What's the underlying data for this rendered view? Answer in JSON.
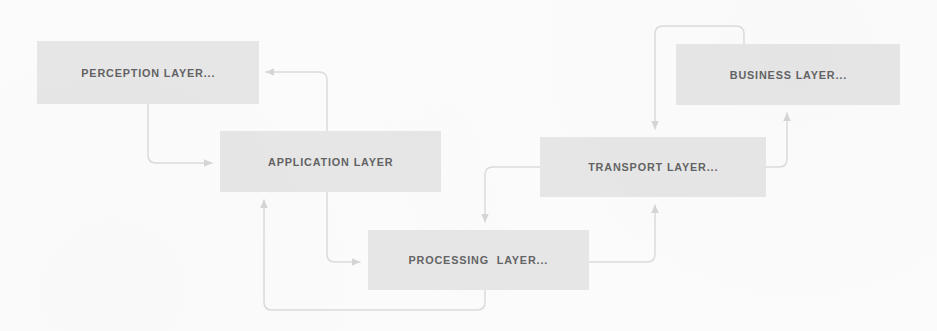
{
  "diagram": {
    "type": "block-flow-diagram",
    "background_color": "#fcfcfc",
    "node_fill_color": "#e7e7e7",
    "edge_color": "#dcdcdc",
    "text_color": "#58585a",
    "nodes": [
      {
        "id": "perception",
        "label": "PERCEPTION LAYER...",
        "x": 37,
        "y": 41,
        "w": 222,
        "h": 63
      },
      {
        "id": "application",
        "label": "APPLICATION LAYER",
        "x": 220,
        "y": 131,
        "w": 221,
        "h": 61
      },
      {
        "id": "processing",
        "label": "PROCESSING  LAYER...",
        "x": 368,
        "y": 230,
        "w": 221,
        "h": 60
      },
      {
        "id": "transport",
        "label": "TRANSPORT LAYER...",
        "x": 540,
        "y": 137,
        "w": 226,
        "h": 60
      },
      {
        "id": "business",
        "label": "BUSINESS LAYER...",
        "x": 676,
        "y": 44,
        "w": 224,
        "h": 61
      }
    ],
    "edges": [
      {
        "id": "application-to-perception",
        "from": "application",
        "to": "perception",
        "label": "",
        "arrow": "left",
        "path": "M 327 131 L 327 80 Q 327 72 319 72 L 266 72"
      },
      {
        "id": "perception-to-application",
        "from": "perception",
        "to": "application",
        "label": "",
        "arrow": "right",
        "path": "M 148 104 L 148 155 Q 148 163 156 163 L 212 163"
      },
      {
        "id": "application-to-processing",
        "from": "application",
        "to": "processing",
        "label": "",
        "arrow": "right",
        "path": "M 327 192 L 327 254 Q 327 262 335 262 L 360 262"
      },
      {
        "id": "processing-to-application",
        "from": "processing",
        "to": "application",
        "label": "",
        "arrow": "up",
        "path": "M 485 290 L 485 302 Q 485 310 477 310 L 272 310 Q 264 310 264 302 L 264 200"
      },
      {
        "id": "transport-to-processing",
        "from": "transport",
        "to": "processing",
        "label": "",
        "arrow": "down",
        "path": "M 540 167 L 493 167 Q 485 167 485 175 L 485 222"
      },
      {
        "id": "processing-to-transport",
        "from": "processing",
        "to": "transport",
        "label": "",
        "arrow": "up",
        "path": "M 589 262 L 647 262 Q 655 262 655 254 L 655 205"
      },
      {
        "id": "business-to-transport",
        "from": "business",
        "to": "transport",
        "label": "",
        "arrow": "down",
        "path": "M 744 44 L 744 34 Q 744 26 736 26 L 663 26 Q 655 26 655 34 L 655 129"
      },
      {
        "id": "transport-to-business",
        "from": "transport",
        "to": "business",
        "label": "",
        "arrow": "up",
        "path": "M 766 167 L 779 167 Q 787 167 787 159 L 787 113"
      }
    ]
  }
}
